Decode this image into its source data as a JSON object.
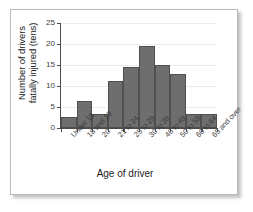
{
  "chart_data": {
    "type": "bar",
    "title": "",
    "xlabel": "Age of driver",
    "ylabel": "Number of drivers\nfatally injured (tens)",
    "categories": [
      "Under 18",
      "18 and 19",
      "20",
      "21 to 24",
      "25 to 29",
      "30 to 39",
      "40 to 49",
      "50 to 59",
      "60 to 64",
      "65 and over"
    ],
    "values": [
      2.7,
      6.5,
      3.4,
      11.2,
      14.5,
      19.5,
      15.0,
      12.8,
      3.4,
      3.4
    ],
    "ylim": [
      0,
      25
    ],
    "yticks": [
      0,
      5,
      10,
      15,
      20,
      25
    ],
    "ytick_labels": [
      "0",
      "5",
      "10",
      "15",
      "20",
      "25"
    ],
    "grid": true,
    "legend": "none",
    "bar_color": "#6e6e6e",
    "bar_edge_color": "#4f4f4f",
    "axis_color": "#4a4a4a",
    "grid_color": "#ececec",
    "background_color": "#ffffff"
  }
}
